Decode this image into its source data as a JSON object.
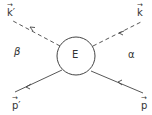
{
  "diagram": {
    "center_label": "E",
    "region_labels": {
      "left": "β",
      "right": "α"
    },
    "legs": [
      {
        "name": "k-prime",
        "label": "k′",
        "style": "dashed",
        "direction": "outgoing",
        "position": "top-left"
      },
      {
        "name": "k",
        "label": "k",
        "style": "dashed",
        "direction": "incoming",
        "position": "top-right"
      },
      {
        "name": "p-prime",
        "label": "p′",
        "style": "solid",
        "direction": "outgoing",
        "position": "bottom-left"
      },
      {
        "name": "p",
        "label": "p",
        "style": "solid",
        "direction": "incoming",
        "position": "bottom-right"
      }
    ],
    "vector_arrow": "→",
    "line_color": "#444444"
  }
}
